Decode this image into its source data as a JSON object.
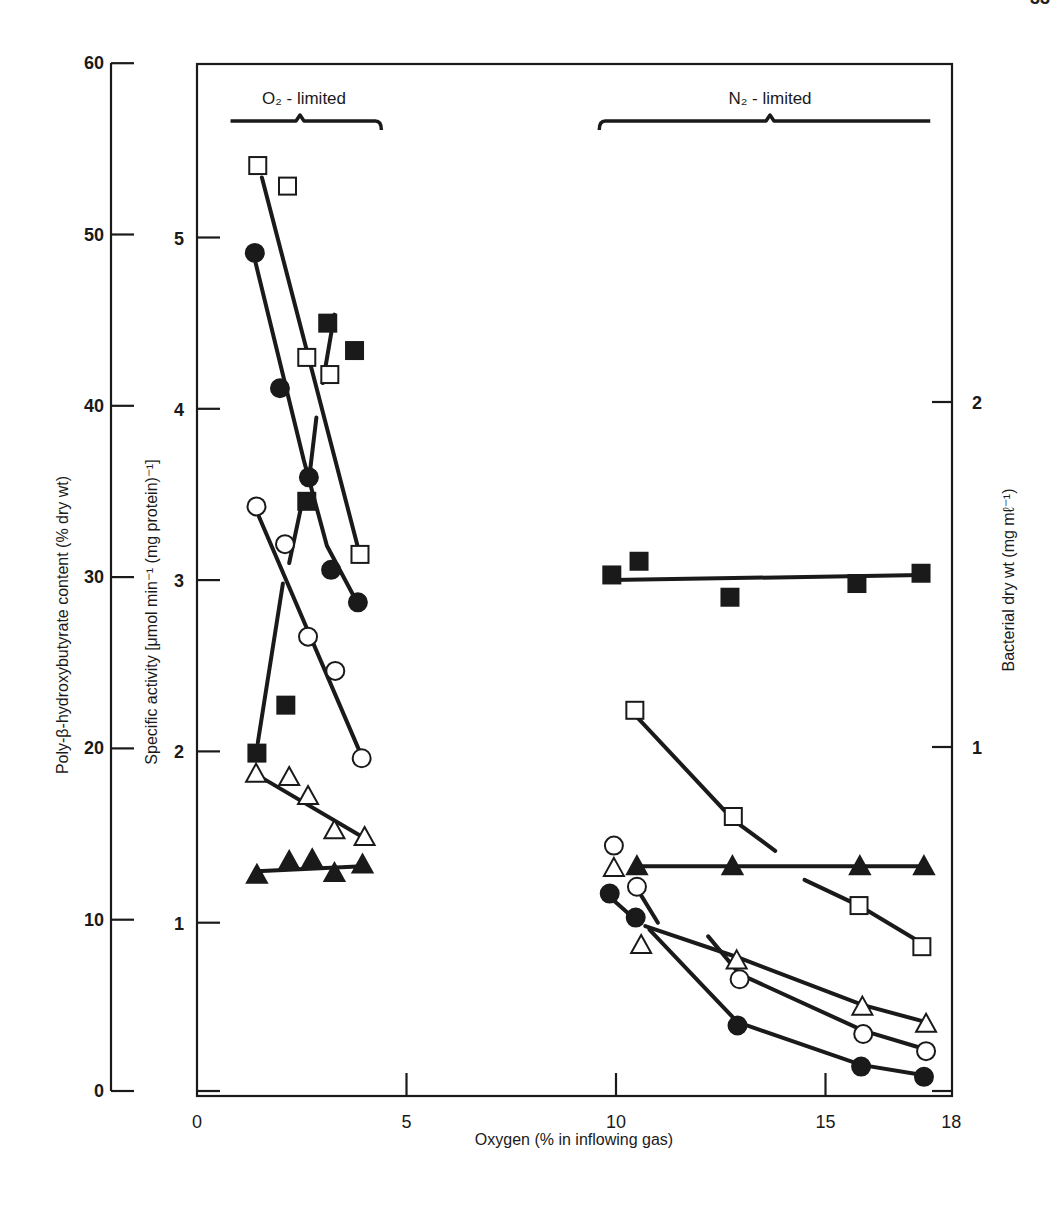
{
  "page_number": "33",
  "chart_data": {
    "type": "scatter",
    "title": "",
    "xlabel": "Oxygen (% in inflowing gas)",
    "x_ticks": [
      0,
      5,
      10,
      15,
      18
    ],
    "xlim": [
      0,
      18
    ],
    "y_axes": [
      {
        "id": "phb",
        "position": "outer-left",
        "label": "Poly-β-hydroxybutyrate content (% dry wt)",
        "ticks": [
          0,
          10,
          20,
          30,
          40,
          50,
          60
        ],
        "ylim": [
          0,
          60
        ]
      },
      {
        "id": "activity",
        "position": "inner-left",
        "label": "Specific activity [μmol min⁻¹ (mg protein)⁻¹]",
        "ticks": [
          1,
          2,
          3,
          4,
          5
        ],
        "ylim": [
          0,
          5.95
        ]
      },
      {
        "id": "drywt",
        "position": "right",
        "label": "Bacterial dry wt (mg mℓ⁻¹)",
        "ticks": [
          1,
          2
        ],
        "ylim": [
          0,
          2.95
        ]
      }
    ],
    "annotations": [
      {
        "text": "O₂ - limited",
        "x_range": [
          0.8,
          4.4
        ]
      },
      {
        "text": "N₂ - limited",
        "x_range": [
          9.6,
          17.5
        ]
      }
    ],
    "grid": false,
    "legend": null,
    "series": [
      {
        "name": "open-square",
        "marker": "square-open",
        "o2_limited": {
          "x": [
            1.45,
            2.16,
            2.62,
            3.17,
            3.89
          ],
          "y": [
            5.42,
            5.3,
            4.3,
            4.2,
            3.15
          ]
        },
        "n2_limited": {
          "x": [
            10.45,
            12.8,
            15.8,
            17.3
          ],
          "y": [
            2.24,
            1.62,
            1.1,
            0.86
          ]
        }
      },
      {
        "name": "filled-circle",
        "marker": "circle-filled",
        "o2_limited": {
          "x": [
            1.38,
            1.98,
            2.67,
            3.2,
            3.84
          ],
          "y": [
            4.91,
            4.12,
            3.6,
            3.06,
            2.87
          ]
        },
        "n2_limited": {
          "x": [
            9.85,
            10.47,
            12.9,
            15.85,
            17.35
          ],
          "y": [
            1.17,
            1.03,
            0.4,
            0.16,
            0.1
          ]
        }
      },
      {
        "name": "open-circle",
        "marker": "circle-open",
        "o2_limited": {
          "x": [
            1.42,
            2.1,
            2.65,
            3.3,
            3.93
          ],
          "y": [
            3.43,
            3.21,
            2.67,
            2.47,
            1.96
          ]
        },
        "n2_limited": {
          "x": [
            9.95,
            10.5,
            12.95,
            15.9,
            17.4
          ],
          "y": [
            1.45,
            1.21,
            0.67,
            0.35,
            0.25
          ]
        }
      },
      {
        "name": "filled-square",
        "marker": "square-filled",
        "o2_limited": {
          "x": [
            1.43,
            2.12,
            2.62,
            3.12,
            3.76
          ],
          "y": [
            1.99,
            2.27,
            3.46,
            4.5,
            4.34
          ]
        },
        "n2_limited": {
          "x": [
            9.9,
            10.55,
            12.72,
            15.75,
            17.28
          ],
          "y": [
            3.03,
            3.11,
            2.9,
            2.98,
            3.04
          ]
        }
      },
      {
        "name": "open-triangle",
        "marker": "triangle-open",
        "o2_limited": {
          "x": [
            1.41,
            2.2,
            2.65,
            3.28,
            4.0
          ],
          "y": [
            1.87,
            1.85,
            1.74,
            1.54,
            1.5
          ]
        },
        "n2_limited": {
          "x": [
            9.95,
            10.6,
            12.88,
            15.88,
            17.4
          ],
          "y": [
            1.32,
            0.87,
            0.78,
            0.51,
            0.41
          ]
        }
      },
      {
        "name": "filled-triangle",
        "marker": "triangle-filled",
        "o2_limited": {
          "x": [
            1.43,
            2.2,
            2.75,
            3.28,
            3.95
          ],
          "y": [
            1.28,
            1.36,
            1.37,
            1.29,
            1.34
          ]
        },
        "n2_limited": {
          "x": [
            10.5,
            12.78,
            15.82,
            17.35
          ],
          "y": [
            1.33,
            1.33,
            1.33,
            1.33
          ]
        }
      }
    ],
    "fitted_lines": [
      {
        "series": "open-square",
        "region": "o2",
        "points": [
          [
            1.55,
            5.35
          ],
          [
            3.83,
            3.2
          ]
        ]
      },
      {
        "series": "filled-circle",
        "region": "o2",
        "points": [
          [
            1.4,
            4.85
          ],
          [
            2.55,
            3.7
          ],
          [
            3.1,
            3.2
          ],
          [
            3.8,
            2.88
          ]
        ]
      },
      {
        "series": "open-circle",
        "region": "o2",
        "points": [
          [
            1.48,
            3.37
          ],
          [
            3.88,
            2.0
          ]
        ]
      },
      {
        "series": "filled-square",
        "region": "o2",
        "points": [
          [
            1.45,
            2.05
          ],
          [
            2.05,
            2.98
          ]
        ],
        "segments": [
          [
            [
              1.45,
              2.05
            ],
            [
              2.05,
              2.98
            ]
          ],
          [
            [
              2.2,
              3.1
            ],
            [
              2.55,
              3.5
            ]
          ],
          [
            [
              2.68,
              3.6
            ],
            [
              2.85,
              3.95
            ]
          ],
          [
            [
              3.0,
              4.15
            ],
            [
              3.28,
              4.55
            ]
          ]
        ]
      },
      {
        "series": "open-triangle",
        "region": "o2",
        "points": [
          [
            1.45,
            1.86
          ],
          [
            3.95,
            1.5
          ]
        ]
      },
      {
        "series": "filled-triangle",
        "region": "o2",
        "points": [
          [
            1.43,
            1.3
          ],
          [
            3.95,
            1.33
          ]
        ]
      },
      {
        "series": "filled-square",
        "region": "n2",
        "points": [
          [
            9.9,
            3.0
          ],
          [
            17.3,
            3.03
          ]
        ]
      },
      {
        "series": "open-square",
        "region": "n2",
        "points": [
          [
            10.5,
            2.2
          ],
          [
            12.8,
            1.6
          ],
          [
            13.9,
            1.4
          ]
        ],
        "segments": [
          [
            [
              10.5,
              2.2
            ],
            [
              12.8,
              1.6
            ],
            [
              13.8,
              1.42
            ]
          ],
          [
            [
              14.5,
              1.25
            ],
            [
              15.8,
              1.1
            ],
            [
              17.3,
              0.88
            ]
          ]
        ]
      },
      {
        "series": "filled-triangle",
        "region": "n2",
        "points": [
          [
            10.5,
            1.33
          ],
          [
            17.35,
            1.33
          ]
        ]
      },
      {
        "series": "open-circle",
        "region": "n2",
        "points": [
          [
            10.55,
            1.18
          ],
          [
            11.0,
            1.0
          ]
        ],
        "segments": [
          [
            [
              10.55,
              1.18
            ],
            [
              11.0,
              1.0
            ]
          ],
          [
            [
              12.2,
              0.92
            ],
            [
              12.95,
              0.7
            ],
            [
              15.9,
              0.37
            ],
            [
              17.4,
              0.26
            ]
          ]
        ]
      },
      {
        "series": "open-triangle",
        "region": "n2",
        "points": [
          [
            10.7,
            0.98
          ],
          [
            17.4,
            0.42
          ]
        ],
        "segments": [
          [
            [
              10.7,
              0.98
            ],
            [
              12.88,
              0.8
            ],
            [
              15.88,
              0.52
            ],
            [
              17.4,
              0.42
            ]
          ]
        ]
      },
      {
        "series": "filled-circle",
        "region": "n2",
        "points": [
          [
            9.9,
            1.14
          ],
          [
            17.35,
            0.1
          ]
        ],
        "segments": [
          [
            [
              9.9,
              1.14
            ],
            [
              10.45,
              1.02
            ]
          ],
          [
            [
              10.8,
              0.96
            ],
            [
              12.0,
              0.65
            ],
            [
              12.9,
              0.42
            ],
            [
              15.85,
              0.17
            ],
            [
              17.35,
              0.11
            ]
          ]
        ]
      }
    ]
  },
  "labels": {
    "o2_region": "O₂ - limited",
    "n2_region": "N₂ - limited",
    "x_axis_title": "Oxygen (% in inflowing gas)",
    "y_outer_title": "Poly-β-hydroxybutyrate content (% dry wt)",
    "y_inner_title": "Specific activity [μmol min⁻¹ (mg protein)⁻¹]",
    "y_right_title": "Bacterial dry wt (mg mℓ⁻¹)"
  }
}
